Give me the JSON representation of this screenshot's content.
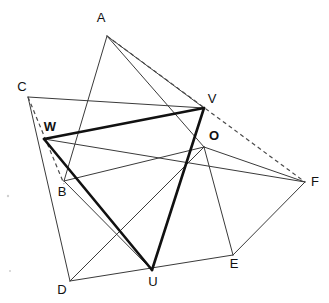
{
  "figure": {
    "width": 329,
    "height": 303,
    "background_color": "#ffffff",
    "line_color_thin": "#3a3a3a",
    "line_color_bold": "#111111",
    "line_color_dashed": "#4a4a4a"
  },
  "points": {
    "A": {
      "label": "A",
      "x": 107,
      "y": 36,
      "label_x": 101,
      "label_y": 22
    },
    "B": {
      "label": "B",
      "x": 64,
      "y": 181,
      "label_x": 58,
      "label_y": 196
    },
    "C": {
      "label": "C",
      "x": 28,
      "y": 97,
      "label_x": 20,
      "label_y": 91
    },
    "D": {
      "label": "D",
      "x": 70,
      "y": 281,
      "label_x": 59,
      "label_y": 293
    },
    "E": {
      "label": "E",
      "x": 233,
      "y": 255,
      "label_x": 229,
      "label_y": 268
    },
    "F": {
      "label": "F",
      "x": 305,
      "y": 182,
      "label_x": 310,
      "label_y": 182
    },
    "O": {
      "label": "O",
      "x": 204,
      "y": 147,
      "label_x": 209,
      "label_y": 140
    },
    "U": {
      "label": "U",
      "x": 152,
      "y": 270,
      "label_x": 148,
      "label_y": 285
    },
    "V": {
      "label": "V",
      "x": 204,
      "y": 108,
      "label_x": 207,
      "label_y": 102
    },
    "W": {
      "label": "W",
      "x": 44,
      "y": 139,
      "label_x": 40,
      "label_y": 132
    }
  },
  "segments": {
    "thin": [
      {
        "name": "segment-A-B",
        "from": "A",
        "to": "B"
      },
      {
        "name": "segment-A-O",
        "from": "A",
        "to": "O"
      },
      {
        "name": "segment-C-V",
        "from": "C",
        "to": "V"
      },
      {
        "name": "segment-C-D",
        "from": "C",
        "to": "D"
      },
      {
        "name": "segment-B-O",
        "from": "B",
        "to": "O"
      },
      {
        "name": "segment-D-E",
        "from": "D",
        "to": "E"
      },
      {
        "name": "segment-D-O",
        "from": "D",
        "to": "O"
      },
      {
        "name": "segment-E-F",
        "from": "E",
        "to": "F"
      },
      {
        "name": "segment-E-O",
        "from": "E",
        "to": "O"
      },
      {
        "name": "segment-F-O",
        "from": "F",
        "to": "O"
      },
      {
        "name": "segment-F-W",
        "from": "F",
        "to": "W"
      },
      {
        "name": "segment-V-U",
        "from": "V",
        "to": "U"
      },
      {
        "name": "segment-B-U",
        "from": "B",
        "to": "U"
      }
    ],
    "bold": [
      {
        "name": "segment-W-V",
        "from": "W",
        "to": "V"
      },
      {
        "name": "segment-V-U",
        "from": "V",
        "to": "U"
      },
      {
        "name": "segment-U-W",
        "from": "U",
        "to": "W"
      }
    ],
    "dashed": [
      {
        "name": "segment-A-F-dashed",
        "from": "A",
        "to": "F"
      },
      {
        "name": "segment-C-B-dashed",
        "from": "C",
        "to": "B"
      }
    ]
  },
  "labels": {
    "A": "A",
    "B": "B",
    "C": "C",
    "D": "D",
    "E": "E",
    "F": "F",
    "O": "O",
    "U": "U",
    "V": "V",
    "W": "W"
  }
}
